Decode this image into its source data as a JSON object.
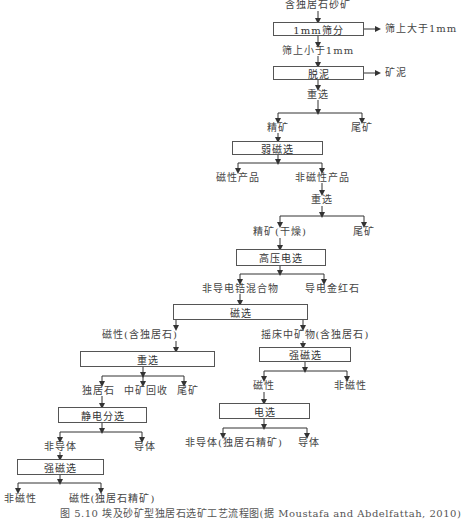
{
  "flowchart": {
    "input": "含独居石砂矿",
    "steps": {
      "screening": "1mm筛分",
      "screening_oversize": "筛上大于1mm",
      "screening_undersize": "筛上小于1mm",
      "desliming": "脱泥",
      "desliming_out": "矿泥",
      "gravity_1": "重选",
      "gravity_1_concentrate": "精矿",
      "gravity_1_tailings": "尾矿",
      "weak_magnetic": "弱磁选",
      "weak_magnetic_magnetic": "磁性产品",
      "weak_magnetic_nonmagnetic": "非磁性产品",
      "gravity_2": "重选",
      "gravity_2_concentrate": "精矿(干燥)",
      "gravity_2_tailings": "尾矿",
      "hv_electrostatic": "高压电选",
      "hv_nonconductive": "非导电锆混合物",
      "hv_conductive": "导电金红石",
      "magnetic": "磁选",
      "magnetic_magnetic": "磁性(含独居石)",
      "magnetic_table_middlings": "摇床中矿物(含独居石)",
      "gravity_3": "重选",
      "gravity_3_monazite": "独居石",
      "gravity_3_middlings": "中矿回收",
      "gravity_3_tailings": "尾矿",
      "electrostatic": "静电分选",
      "electrostatic_nonconductor": "非导体",
      "electrostatic_conductor": "导体",
      "strong_magnetic_left": "强磁选",
      "strong_magnetic_left_nonmagnetic": "非磁性",
      "strong_magnetic_left_magnetic": "磁性(独居石精矿)",
      "strong_magnetic_right": "强磁选",
      "strong_magnetic_right_magnetic": "磁性",
      "strong_magnetic_right_nonmagnetic": "非磁性",
      "electric_sep": "电选",
      "electric_sep_nonconductor": "非导体(独居石精矿)",
      "electric_sep_conductor": "导体"
    }
  },
  "caption": "图 5.10   埃及砂矿型独居石选矿工艺流程图(据 Moustafa and Abdelfattah, 2010)",
  "colors": {
    "line": "#333333",
    "box_border": "#555555",
    "text": "#333333"
  }
}
